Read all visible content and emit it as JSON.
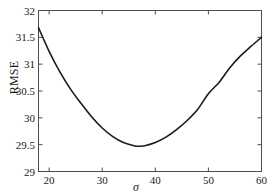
{
  "chart_data": {
    "type": "line",
    "title": "",
    "subtitle": "",
    "xlabel": "σ",
    "ylabel": "RMSE",
    "xlim": [
      18,
      60
    ],
    "ylim": [
      29,
      32
    ],
    "grid": false,
    "legend": null,
    "xticks": [
      20,
      30,
      40,
      50,
      60
    ],
    "xtick_labels": [
      "20",
      "30",
      "40",
      "50",
      "60"
    ],
    "yticks": [
      29,
      29.5,
      30,
      30.5,
      31,
      31.5,
      32
    ],
    "ytick_labels": [
      "29",
      "29.5",
      "30",
      "30.5",
      "31",
      "31.5",
      "32"
    ],
    "series": [
      {
        "name": "RMSE curve",
        "color": "#1a1a1a",
        "x": [
          18,
          20,
          22,
          24,
          26,
          28,
          30,
          32,
          34,
          36,
          36.5,
          38,
          40,
          42,
          44,
          46,
          48,
          50,
          52,
          54,
          56,
          58,
          60
        ],
        "y": [
          31.68,
          31.24,
          30.86,
          30.54,
          30.27,
          30.02,
          29.81,
          29.65,
          29.54,
          29.48,
          29.47,
          29.48,
          29.54,
          29.64,
          29.78,
          29.95,
          30.16,
          30.45,
          30.66,
          30.93,
          31.15,
          31.33,
          31.5
        ]
      }
    ],
    "annotations": {
      "minimum_x": 36.5,
      "minimum_y": 29.47
    }
  },
  "axes": {
    "frame_color": "#4d4d4d",
    "tick_direction": "in",
    "box": true
  }
}
